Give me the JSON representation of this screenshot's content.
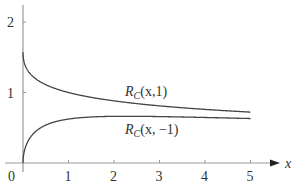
{
  "chart_data": {
    "type": "line",
    "title": "",
    "xlabel": "x",
    "ylabel": "",
    "xlim": [
      0,
      5.4
    ],
    "ylim": [
      0,
      2.2
    ],
    "grid": false,
    "legend": "inline labels",
    "x_ticks": [
      "0",
      "1",
      "2",
      "3",
      "4",
      "5"
    ],
    "y_ticks": [
      "1",
      "2"
    ],
    "x": [
      0,
      0.05,
      0.1,
      0.25,
      0.5,
      0.75,
      1,
      1.5,
      2,
      2.5,
      3,
      4,
      5
    ],
    "series": [
      {
        "name": "R_C(x,1)",
        "label_main": "R",
        "label_sub": "C",
        "label_args": "(x,1)",
        "values": [
          1.5708,
          1.3802,
          1.3166,
          1.2092,
          1.1107,
          1.0472,
          1.0,
          0.9312,
          0.8814,
          0.8424,
          0.8105,
          0.7603,
          0.7218
        ]
      },
      {
        "name": "R_C(x,-1)",
        "label_main": "R",
        "label_sub": "C",
        "label_args": "(x, −1)",
        "values": [
          0,
          0.2165,
          0.2966,
          0.4304,
          0.5377,
          0.5923,
          0.6232,
          0.6525,
          0.6617,
          0.6655,
          0.6585,
          0.6456,
          0.6397
        ]
      }
    ]
  }
}
